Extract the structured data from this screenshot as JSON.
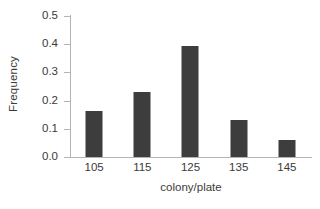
{
  "chart_data": {
    "type": "bar",
    "title": "",
    "subtitle": "",
    "xlabel": "colony/plate",
    "ylabel": "Frequency",
    "categories": [
      "105",
      "115",
      "125",
      "135",
      "145"
    ],
    "values": [
      0.163,
      0.23,
      0.395,
      0.13,
      0.062
    ],
    "series": [
      {
        "name": "Frequency",
        "values": [
          0.163,
          0.23,
          0.395,
          0.13,
          0.062
        ]
      }
    ],
    "ylim": [
      0.0,
      0.5
    ],
    "ytick_labels": [
      "0.0",
      "0.1",
      "0.2",
      "0.3",
      "0.4",
      "0.5"
    ],
    "ytick_values": [
      0.0,
      0.1,
      0.2,
      0.3,
      0.4,
      0.5
    ],
    "xtick_labels": [
      "105",
      "115",
      "125",
      "135",
      "145"
    ],
    "grid": false,
    "legend": false,
    "legend_position": "none",
    "annotations": [],
    "colors": {
      "bar": "#3d3d3d",
      "axis": "#b4b4b4",
      "text": "#3a3a3a",
      "background": "#ffffff"
    }
  }
}
